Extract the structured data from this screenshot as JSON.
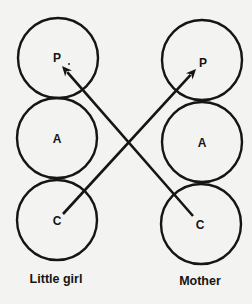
{
  "diagram": {
    "type": "transactional-analysis",
    "people": [
      {
        "label": "Little girl",
        "label_pos": [
          56,
          283
        ],
        "ego_states": [
          {
            "letter": "P",
            "cx": 58,
            "cy": 58,
            "r": 40,
            "lx": 57,
            "ly": 58
          },
          {
            "letter": "A",
            "cx": 57,
            "cy": 138,
            "r": 40,
            "lx": 57,
            "ly": 139
          },
          {
            "letter": "C",
            "cx": 57,
            "cy": 220,
            "r": 40,
            "lx": 57,
            "ly": 221
          }
        ]
      },
      {
        "label": "Mother",
        "label_pos": [
          200,
          285
        ],
        "ego_states": [
          {
            "letter": "P",
            "cx": 202,
            "cy": 60,
            "r": 40,
            "lx": 203,
            "ly": 63
          },
          {
            "letter": "A",
            "cx": 202,
            "cy": 142,
            "r": 40,
            "lx": 202,
            "ly": 143
          },
          {
            "letter": "C",
            "cx": 201,
            "cy": 224,
            "r": 40,
            "lx": 200,
            "ly": 225
          }
        ]
      }
    ],
    "transactions": [
      {
        "from": "Mother C",
        "to": "Little girl P",
        "x1": 193,
        "y1": 216,
        "x2": 62,
        "y2": 66
      },
      {
        "from": "Little girl C",
        "to": "Mother P",
        "x1": 63,
        "y1": 214,
        "x2": 196,
        "y2": 69
      }
    ],
    "stray_mark": {
      "x": 69,
      "y": 64,
      "text": "·"
    },
    "colors": {
      "ink": "#151515",
      "paper": "#f3f3f1"
    }
  }
}
